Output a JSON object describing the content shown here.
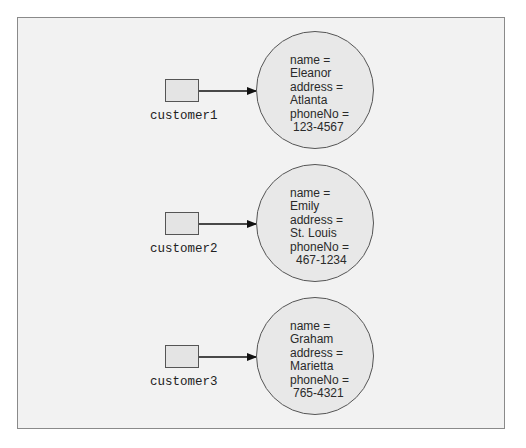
{
  "diagram": {
    "references": [
      {
        "variable": "customer1",
        "object": {
          "lines": [
            "name =",
            "Eleanor",
            "address =",
            "Atlanta",
            "phoneNo =",
            "123-4567"
          ]
        }
      },
      {
        "variable": "customer2",
        "object": {
          "lines": [
            "name =",
            "Emily",
            "address =",
            "St. Louis",
            "phoneNo =",
            "467-1234"
          ]
        }
      },
      {
        "variable": "customer3",
        "object": {
          "lines": [
            "name =",
            "Graham",
            "address =",
            "Marietta",
            "phoneNo =",
            "765-4321"
          ]
        }
      }
    ],
    "colors": {
      "background": "#f2f2f2",
      "frame_border": "#8a8a8a",
      "shape_fill": "#e8e8e8",
      "stroke": "#555555"
    }
  }
}
